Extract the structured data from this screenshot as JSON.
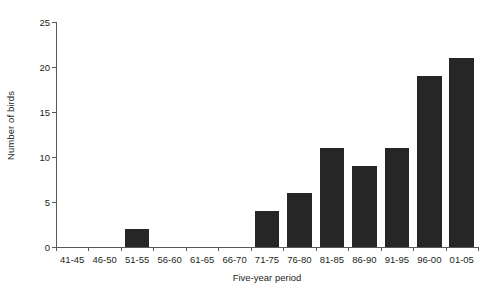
{
  "chart_data": {
    "type": "bar",
    "title": "",
    "subtitle": "",
    "xlabel": "Five-year period",
    "ylabel": "Number of birds",
    "categories": [
      "41-45",
      "46-50",
      "51-55",
      "56-60",
      "61-65",
      "66-70",
      "71-75",
      "76-80",
      "81-85",
      "86-90",
      "91-95",
      "96-00",
      "01-05"
    ],
    "values": [
      0,
      0,
      2,
      0,
      0,
      0,
      4,
      6,
      11,
      9,
      11,
      19,
      21
    ],
    "ylim": [
      0,
      25
    ],
    "yticks": [
      0,
      5,
      10,
      15,
      20,
      25
    ],
    "ytick_labels": [
      "0",
      "5",
      "10",
      "15",
      "20",
      "25"
    ],
    "grid": false,
    "legend": false,
    "legend_position": "none",
    "bar_color": "#262626",
    "axis_color": "#58595b",
    "text_color": "#231f20",
    "background_color": "#ffffff",
    "annotations": []
  }
}
